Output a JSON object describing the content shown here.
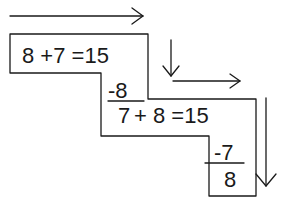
{
  "diagram": {
    "step1": {
      "equation": "8 +7 =15",
      "subtract": "-8",
      "result": "7"
    },
    "step2": {
      "equation": "+ 8 =15",
      "subtract": "-7",
      "result": "8"
    }
  }
}
